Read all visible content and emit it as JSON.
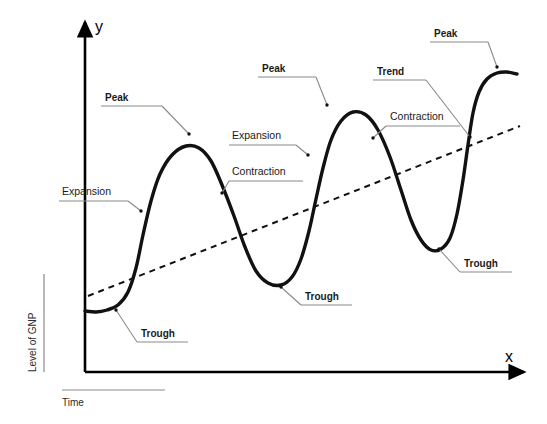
{
  "figure": {
    "background_color": "#ffffff",
    "curve_color": "#111111",
    "axis_color": "#000000",
    "leader_color": "#8a8a8a",
    "text_color": "#1a1a1a"
  },
  "axes": {
    "y_letter": "y",
    "x_letter": "x",
    "y_caption": "Level of GNP",
    "x_caption": "Time"
  },
  "annotations": [
    {
      "id": "peak-1",
      "label": "Peak",
      "bold": true,
      "text_x": 105,
      "text_y": 101,
      "rule_x1": 101,
      "rule_x2": 162,
      "rule_y": 106,
      "tip_x": 189,
      "tip_y": 134
    },
    {
      "id": "expansion-1",
      "label": "Expansion",
      "bold": false,
      "text_x": 62,
      "text_y": 195,
      "rule_x1": 59,
      "rule_x2": 128,
      "rule_y": 201,
      "tip_x": 141,
      "tip_y": 211
    },
    {
      "id": "trough-1",
      "label": "Trough",
      "bold": true,
      "text_x": 141,
      "text_y": 337,
      "rule_x1": 137,
      "rule_x2": 188,
      "rule_y": 342,
      "tip_x": 116,
      "tip_y": 310
    },
    {
      "id": "expansion-2",
      "label": "Expansion",
      "bold": false,
      "text_x": 232,
      "text_y": 139,
      "rule_x1": 229,
      "rule_x2": 296,
      "rule_y": 145,
      "tip_x": 308,
      "tip_y": 155
    },
    {
      "id": "contraction-1",
      "label": "Contraction",
      "bold": false,
      "text_x": 232,
      "text_y": 175,
      "rule_x1": 229,
      "rule_x2": 303,
      "rule_y": 181,
      "tip_x": 222,
      "tip_y": 193
    },
    {
      "id": "peak-2",
      "label": "Peak",
      "bold": true,
      "text_x": 262,
      "text_y": 72,
      "rule_x1": 258,
      "rule_x2": 316,
      "rule_y": 77,
      "tip_x": 327,
      "tip_y": 105
    },
    {
      "id": "trough-2",
      "label": "Trough",
      "bold": true,
      "text_x": 305,
      "text_y": 300,
      "rule_x1": 301,
      "rule_x2": 352,
      "rule_y": 305,
      "tip_x": 281,
      "tip_y": 287
    },
    {
      "id": "trend",
      "label": "Trend",
      "bold": true,
      "text_x": 377,
      "text_y": 75,
      "rule_x1": 373,
      "rule_x2": 426,
      "rule_y": 80,
      "tip_x": 470,
      "tip_y": 137
    },
    {
      "id": "contraction-2",
      "label": "Contraction",
      "bold": false,
      "text_x": 390,
      "text_y": 120,
      "rule_x1": 386,
      "rule_x2": 460,
      "rule_y": 126,
      "tip_x": 373,
      "tip_y": 138
    },
    {
      "id": "peak-3",
      "label": "Peak",
      "bold": true,
      "text_x": 434,
      "text_y": 37,
      "rule_x1": 430,
      "rule_x2": 488,
      "rule_y": 42,
      "tip_x": 497,
      "tip_y": 67
    },
    {
      "id": "trough-3",
      "label": "Trough",
      "bold": true,
      "text_x": 464,
      "text_y": 267,
      "rule_x1": 460,
      "rule_x2": 512,
      "rule_y": 272,
      "tip_x": 439,
      "tip_y": 249
    }
  ],
  "chart_data": {
    "type": "line",
    "xlabel": "Time",
    "ylabel": "Level of GNP",
    "grid": false,
    "legend": "none",
    "axis_tick_labels": {
      "x": [],
      "y": []
    },
    "series": [
      {
        "name": "Level of GNP",
        "style": "solid",
        "linewidth": 3.4,
        "description": "Cyclical business-cycle wave with three peaks and three troughs rising over time",
        "points": [
          [
            85,
            311
          ],
          [
            96,
            312
          ],
          [
            107,
            310
          ],
          [
            118,
            305
          ],
          [
            128,
            292
          ],
          [
            136,
            268
          ],
          [
            143,
            235
          ],
          [
            151,
            201
          ],
          [
            160,
            174
          ],
          [
            172,
            155
          ],
          [
            186,
            146
          ],
          [
            199,
            148
          ],
          [
            211,
            161
          ],
          [
            222,
            185
          ],
          [
            234,
            216
          ],
          [
            245,
            247
          ],
          [
            256,
            271
          ],
          [
            268,
            283
          ],
          [
            281,
            285
          ],
          [
            292,
            277
          ],
          [
            301,
            259
          ],
          [
            309,
            231
          ],
          [
            316,
            199
          ],
          [
            323,
            168
          ],
          [
            331,
            140
          ],
          [
            341,
            121
          ],
          [
            353,
            112
          ],
          [
            366,
            115
          ],
          [
            378,
            130
          ],
          [
            390,
            157
          ],
          [
            401,
            190
          ],
          [
            411,
            220
          ],
          [
            421,
            240
          ],
          [
            431,
            250
          ],
          [
            441,
            249
          ],
          [
            450,
            238
          ],
          [
            457,
            214
          ],
          [
            463,
            180
          ],
          [
            468,
            145
          ],
          [
            473,
            113
          ],
          [
            479,
            92
          ],
          [
            487,
            79
          ],
          [
            497,
            73
          ],
          [
            507,
            72
          ],
          [
            517,
            74
          ]
        ],
        "markers": [
          {
            "kind": "peak",
            "index": 1,
            "x": 189,
            "y": 146
          },
          {
            "kind": "trough",
            "index": 1,
            "x": 116,
            "y": 310
          },
          {
            "kind": "peak",
            "index": 2,
            "x": 327,
            "y": 111
          },
          {
            "kind": "trough",
            "index": 2,
            "x": 281,
            "y": 285
          },
          {
            "kind": "peak",
            "index": 3,
            "x": 499,
            "y": 72
          },
          {
            "kind": "trough",
            "index": 3,
            "x": 437,
            "y": 250
          }
        ]
      },
      {
        "name": "Trend",
        "style": "dashed",
        "linewidth": 2,
        "description": "Straight upward-sloping long-run trend line",
        "points": [
          [
            88,
            296
          ],
          [
            520,
            126
          ]
        ]
      }
    ],
    "axis_geometry": {
      "origin_x": 85,
      "origin_y": 372,
      "y_axis_top": 18,
      "x_axis_right": 530
    }
  }
}
